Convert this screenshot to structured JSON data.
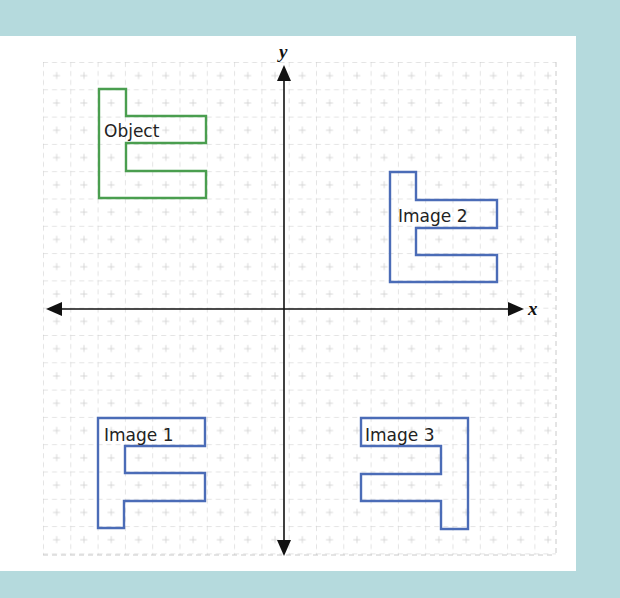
{
  "diagram": {
    "type": "coordinate-plane-transformations",
    "axes": {
      "x_label": "x",
      "y_label": "y"
    },
    "colors": {
      "frame": "#b5dadd",
      "object": "#4a9e4f",
      "images": "#4b6cb7",
      "grid": "#bcbcbc",
      "axis": "#111111"
    },
    "shapes": [
      {
        "name": "object",
        "label": "Object",
        "quadrant": "II"
      },
      {
        "name": "image-2",
        "label": "Image 2",
        "quadrant": "I"
      },
      {
        "name": "image-1",
        "label": "Image 1",
        "quadrant": "III"
      },
      {
        "name": "image-3",
        "label": "Image 3",
        "quadrant": "IV"
      }
    ]
  }
}
